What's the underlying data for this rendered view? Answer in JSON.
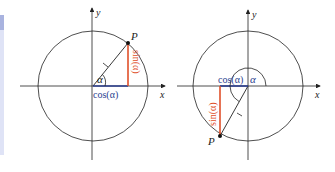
{
  "diagrams": [
    {
      "id": "quadrant1",
      "axis_x_label": "x",
      "axis_y_label": "y",
      "point_label": "P",
      "radius_label": "1",
      "angle_label": "α",
      "cos_label": "cos(α)",
      "sin_label": "sin(α)"
    },
    {
      "id": "quadrant3",
      "axis_x_label": "x",
      "axis_y_label": "y",
      "point_label": "P",
      "radius_label": "1",
      "angle_label": "α",
      "cos_label": "cos(α)",
      "sin_label": "sin(α)"
    }
  ],
  "colors": {
    "axis": "#222222",
    "cos": "#2b3e8f",
    "sin": "#e0502a",
    "panel": "#dfe3f6"
  }
}
